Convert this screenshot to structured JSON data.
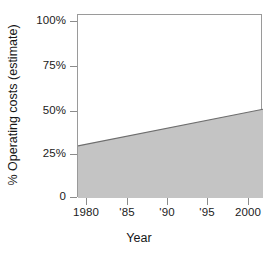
{
  "chart_data": {
    "type": "area",
    "title": "",
    "xlabel": "Year",
    "ylabel": "% Operating costs (estimate)",
    "xlim": [
      1978.2,
      2001.2
    ],
    "ylim": [
      0,
      100
    ],
    "grid": false,
    "legend": null,
    "fill_color": "#c4c4c4",
    "line_color": "#6e6e6e",
    "frame_color": "#9a9a9a",
    "x": [
      1978.2,
      2001.2
    ],
    "values": [
      28.5,
      48.5
    ],
    "series": [
      {
        "name": "% Operating costs (estimate)",
        "x": [
          1978.2,
          2001.2
        ],
        "values": [
          28.5,
          48.5
        ]
      }
    ],
    "xticks": [
      {
        "value": 1980,
        "label": "1980",
        "px": 86
      },
      {
        "value": 1985,
        "label": "'85",
        "px": 127
      },
      {
        "value": 1990,
        "label": "'90",
        "px": 167
      },
      {
        "value": 1995,
        "label": "'95",
        "px": 207
      },
      {
        "value": 2000,
        "label": "2000",
        "px": 248
      }
    ],
    "yticks": [
      {
        "value": 100,
        "label": "100%",
        "px": 21
      },
      {
        "value": 75,
        "label": "75%",
        "px": 66
      },
      {
        "value": 50,
        "label": "50%",
        "px": 111
      },
      {
        "value": 25,
        "label": "25%",
        "px": 154
      },
      {
        "value": 0,
        "label": "0",
        "px": 197
      }
    ]
  }
}
